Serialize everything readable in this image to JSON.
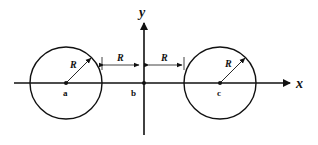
{
  "diagram": {
    "axes": {
      "x_label": "x",
      "y_label": "y"
    },
    "points": [
      {
        "id": "a",
        "label": "a",
        "cx": 66,
        "cy": 83
      },
      {
        "id": "b",
        "label": "b",
        "cx": 144,
        "cy": 83
      },
      {
        "id": "c",
        "label": "c",
        "cx": 220,
        "cy": 83
      }
    ],
    "circles": [
      {
        "center": "a",
        "radius_label": "R"
      },
      {
        "center": "c",
        "radius_label": "R"
      }
    ],
    "dimensions": [
      {
        "from": "circle-a-edge",
        "to": "b",
        "label": "R"
      },
      {
        "from": "b",
        "to": "circle-c-edge",
        "label": "R"
      }
    ],
    "colors": {
      "stroke": "#111111",
      "background": "#ffffff"
    }
  }
}
